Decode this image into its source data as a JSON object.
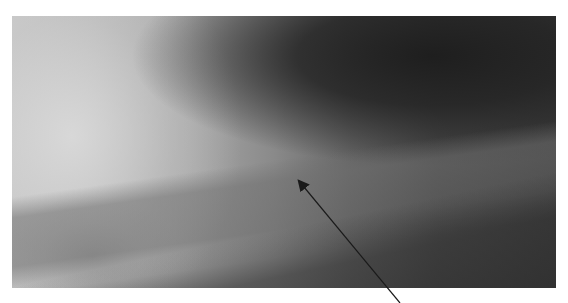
{
  "image": {
    "description": "Grayscale radiograph of hip/proximal femur region",
    "annotation": {
      "type": "arrow",
      "color": "#1a1a1a",
      "tip": [
        298,
        180
      ],
      "tail": [
        400,
        303
      ]
    }
  }
}
